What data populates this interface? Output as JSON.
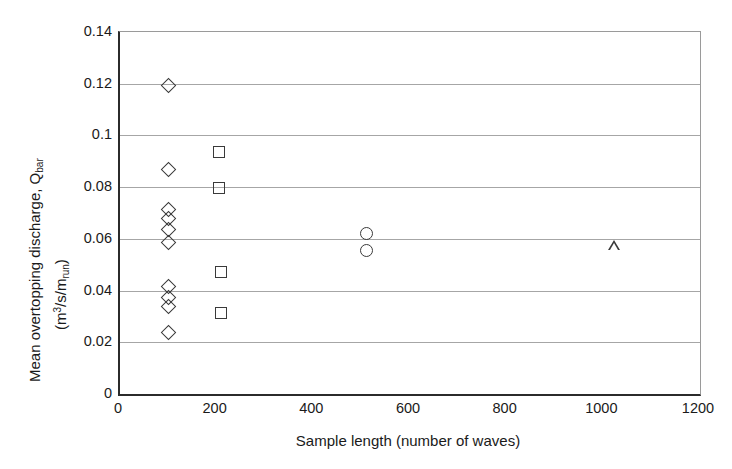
{
  "chart_data": {
    "type": "scatter",
    "title": "",
    "xlabel": "Sample length (number of waves)",
    "ylabel_main": "Mean overtopping discharge, Q",
    "ylabel_main_sub": "bar",
    "ylabel_units_prefix": "(m",
    "ylabel_units_sup": "3",
    "ylabel_units_mid": "/s/m",
    "ylabel_units_sub": "run",
    "ylabel_units_suffix": ")",
    "xlim": [
      0,
      1200
    ],
    "ylim": [
      0,
      0.14
    ],
    "xticks": [
      0,
      200,
      400,
      600,
      800,
      1000,
      1200
    ],
    "xtick_labels": [
      "0",
      "200",
      "400",
      "600",
      "800",
      "1000",
      "1200"
    ],
    "yticks": [
      0,
      0.02,
      0.04,
      0.06,
      0.08,
      0.1,
      0.12,
      0.14
    ],
    "ytick_labels": [
      "0",
      "0.02",
      "0.04",
      "0.06",
      "0.08",
      "0.1",
      "0.12",
      "0.14"
    ],
    "grid": "horizontal",
    "legend": "none",
    "marker_color": "#3a3a3a",
    "marker_fill": "none",
    "series": [
      {
        "name": "100 waves",
        "marker": "diamond",
        "points": [
          {
            "x": 100,
            "y": 0.1195
          },
          {
            "x": 100,
            "y": 0.0868
          },
          {
            "x": 100,
            "y": 0.0715
          },
          {
            "x": 100,
            "y": 0.0677
          },
          {
            "x": 100,
            "y": 0.0635
          },
          {
            "x": 100,
            "y": 0.0586
          },
          {
            "x": 100,
            "y": 0.0414
          },
          {
            "x": 100,
            "y": 0.0375
          },
          {
            "x": 100,
            "y": 0.0337
          },
          {
            "x": 100,
            "y": 0.0236
          }
        ]
      },
      {
        "name": "200 waves",
        "marker": "square",
        "points": [
          {
            "x": 205,
            "y": 0.0935
          },
          {
            "x": 205,
            "y": 0.0795
          },
          {
            "x": 208,
            "y": 0.0472
          },
          {
            "x": 208,
            "y": 0.0312
          }
        ]
      },
      {
        "name": "500 waves",
        "marker": "circle",
        "points": [
          {
            "x": 510,
            "y": 0.062
          },
          {
            "x": 510,
            "y": 0.0555
          }
        ]
      },
      {
        "name": "1000 waves",
        "marker": "triangle",
        "points": [
          {
            "x": 1022,
            "y": 0.0575
          }
        ]
      }
    ]
  }
}
